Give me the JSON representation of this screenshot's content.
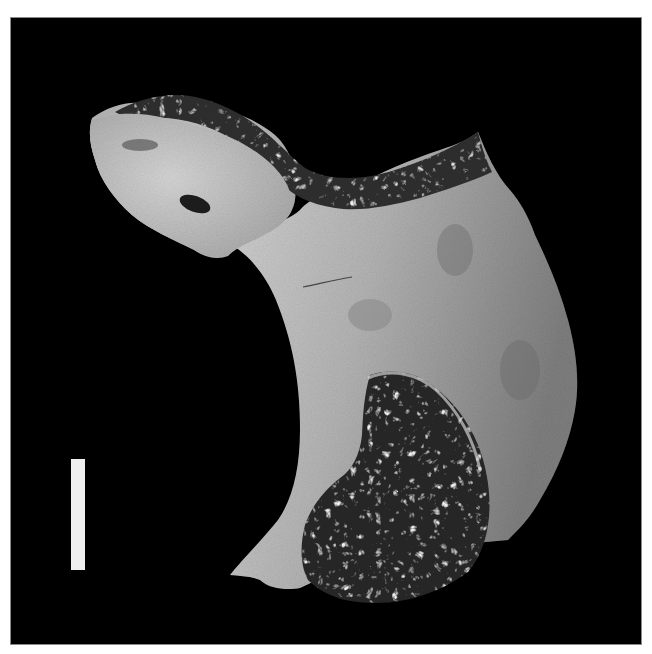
{
  "figure": {
    "background_color": "#000000",
    "page_color": "#ffffff",
    "bone_colors": {
      "cortical_light": "#cfcfcf",
      "cortical_mid": "#a9a9a9",
      "cortical_dark": "#7e7e7e",
      "trabecular_dark": "#2a2a2a"
    },
    "scale_bar": {
      "color": "#efefef",
      "orientation": "vertical",
      "label": ""
    }
  }
}
